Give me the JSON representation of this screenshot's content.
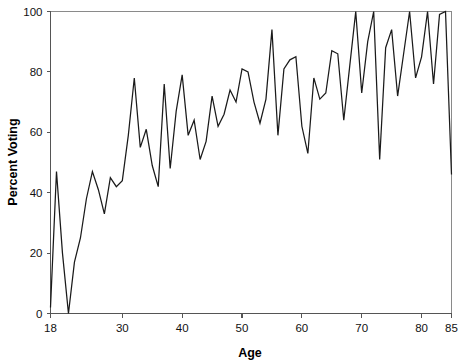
{
  "chart_data": {
    "type": "line",
    "title": "",
    "xlabel": "Age",
    "ylabel": "Percent Voting",
    "xlim": [
      18,
      85
    ],
    "ylim": [
      0,
      100
    ],
    "grid": false,
    "legend": false,
    "xticks": [
      18,
      30,
      40,
      50,
      60,
      70,
      80,
      85
    ],
    "xticklabels": [
      "18",
      "30",
      "40",
      "50",
      "60",
      "70",
      "80",
      "85"
    ],
    "yticks": [
      0,
      20,
      40,
      60,
      80,
      100
    ],
    "yticklabels": [
      "0",
      "20",
      "40",
      "60",
      "80",
      "100"
    ],
    "series": [
      {
        "name": "Percent Voting",
        "color": "#1a1a1a",
        "x": [
          18,
          19,
          20,
          21,
          22,
          23,
          24,
          25,
          26,
          27,
          28,
          29,
          30,
          31,
          32,
          33,
          34,
          35,
          36,
          37,
          38,
          39,
          40,
          41,
          42,
          43,
          44,
          45,
          46,
          47,
          48,
          49,
          50,
          51,
          52,
          53,
          54,
          55,
          56,
          57,
          58,
          59,
          60,
          61,
          62,
          63,
          64,
          65,
          66,
          67,
          68,
          69,
          70,
          71,
          72,
          73,
          74,
          75,
          76,
          77,
          78,
          79,
          80,
          81,
          82,
          83,
          84,
          85
        ],
        "values": [
          2,
          47,
          20,
          0,
          17,
          25,
          38,
          47,
          41,
          33,
          45,
          42,
          44,
          59,
          78,
          55,
          61,
          49,
          42,
          76,
          48,
          67,
          79,
          59,
          64,
          51,
          57,
          72,
          62,
          66,
          74,
          70,
          81,
          80,
          70,
          63,
          71,
          94,
          59,
          81,
          84,
          85,
          62,
          53,
          78,
          71,
          73,
          87,
          86,
          64,
          82,
          100,
          73,
          90,
          100,
          51,
          88,
          94,
          72,
          86,
          100,
          78,
          85,
          101,
          76,
          99,
          100,
          46
        ]
      }
    ]
  },
  "axis": {
    "x_title": "Age",
    "y_title": "Percent Voting"
  }
}
